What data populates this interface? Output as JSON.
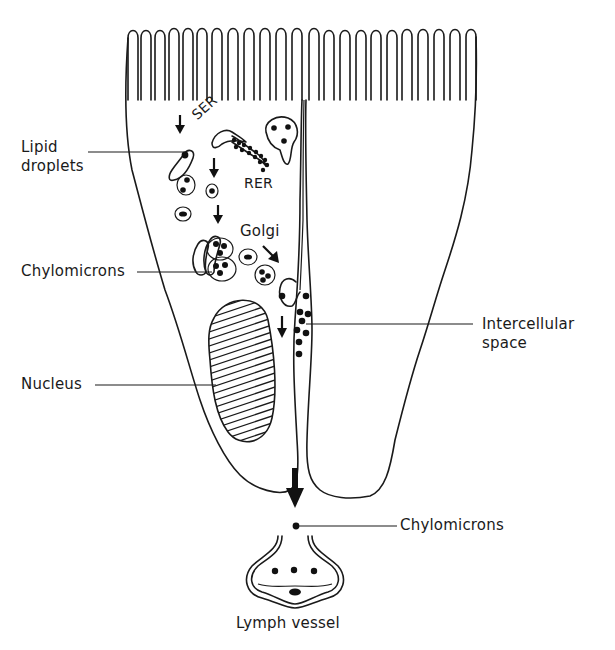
{
  "figure": {
    "labels": {
      "lipid_droplets": [
        "Lipid",
        "droplets"
      ],
      "ser": "SER",
      "rer": "RER",
      "golgi": "Golgi",
      "chylomicrons_cell": "Chylomicrons",
      "intercellular_space": [
        "Intercellular",
        "space"
      ],
      "nucleus": "Nucleus",
      "chylomicrons_lymph": "Chylomicrons",
      "lymph_vessel": "Lymph vessel"
    },
    "structures": [
      "microvilli-brush-border",
      "left-epithelial-cell",
      "right-epithelial-cell",
      "intercellular-space",
      "smooth-endoplasmic-reticulum",
      "rough-endoplasmic-reticulum",
      "golgi-apparatus",
      "nucleus",
      "lymph-vessel"
    ],
    "colors": {
      "ink": "#1a1a1a",
      "background": "#ffffff"
    }
  }
}
